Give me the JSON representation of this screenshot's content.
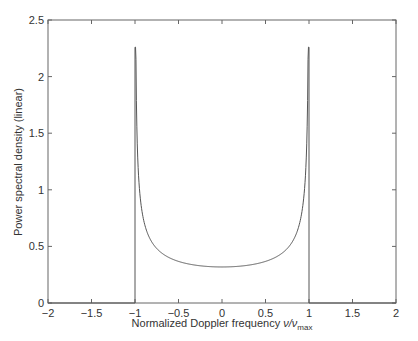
{
  "chart_data": {
    "type": "line",
    "title": "",
    "xlabel": "Normalized Doppler frequency ν/ν_max",
    "xlabel_main": "Normalized Doppler frequency ",
    "xlabel_nu": "ν/ν",
    "xlabel_sub": "max",
    "ylabel": "Power spectral density (linear)",
    "xlim": [
      -2,
      2
    ],
    "ylim": [
      0,
      2.5
    ],
    "xticks": [
      -2,
      -1.5,
      -1,
      -0.5,
      0,
      0.5,
      1,
      1.5,
      2
    ],
    "xtick_labels": [
      "−2",
      "−1.5",
      "−1",
      "−0.5",
      "0",
      "0.5",
      "1",
      "1.5",
      "2"
    ],
    "yticks": [
      0,
      0.5,
      1,
      1.5,
      2,
      2.5
    ],
    "ytick_labels": [
      "0",
      "0.5",
      "1",
      "1.5",
      "2",
      "2.5"
    ],
    "grid": false,
    "legend": null,
    "line_color": "#555555",
    "series": [
      {
        "name": "Doppler PSD",
        "x": [
          -2,
          -1.5,
          -1.0,
          -1.0,
          -0.999,
          -0.99,
          -0.98,
          -0.95,
          -0.9,
          -0.85,
          -0.8,
          -0.7,
          -0.6,
          -0.5,
          -0.4,
          -0.3,
          -0.2,
          -0.1,
          0,
          0.1,
          0.2,
          0.3,
          0.4,
          0.5,
          0.6,
          0.7,
          0.8,
          0.85,
          0.9,
          0.95,
          0.98,
          0.99,
          0.999,
          1.0,
          1.0,
          1.5,
          2
        ],
        "y": [
          0,
          0,
          0,
          2.26,
          2.26,
          2.26,
          1.61,
          1.02,
          0.73,
          0.6,
          0.53,
          0.45,
          0.4,
          0.37,
          0.35,
          0.33,
          0.325,
          0.32,
          0.318,
          0.32,
          0.325,
          0.33,
          0.35,
          0.37,
          0.4,
          0.45,
          0.53,
          0.6,
          0.73,
          1.02,
          1.61,
          2.26,
          2.26,
          2.26,
          0,
          0,
          0
        ]
      }
    ]
  }
}
